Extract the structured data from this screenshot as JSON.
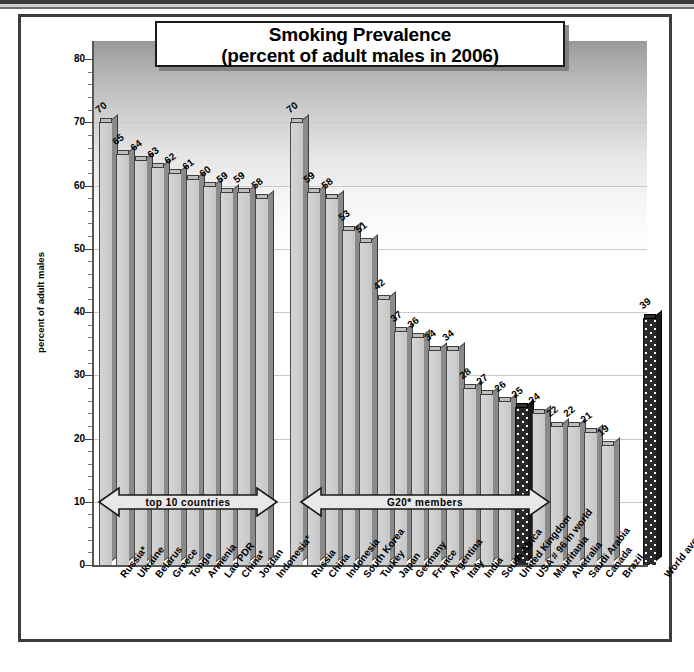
{
  "title": {
    "line1": "Smoking Prevalence",
    "line2": "(percent of adult males in 2006)"
  },
  "chart_data": {
    "type": "bar",
    "title": "Smoking Prevalence (percent of adult males in 2006)",
    "xlabel": "",
    "ylabel": "percent of adult males",
    "ylim": [
      0,
      80
    ],
    "ytick_labels": [
      "0",
      "10",
      "20",
      "30",
      "40",
      "50",
      "60",
      "70",
      "80"
    ],
    "ytick_values": [
      0,
      10,
      20,
      30,
      40,
      50,
      60,
      70,
      80
    ],
    "grid": true,
    "legend": "none",
    "groups": [
      {
        "name": "top 10 countries",
        "annotation": "top 10 countries",
        "categories": [
          "Russia*",
          "Ukraine",
          "Belarus",
          "Greece",
          "Tonga",
          "Armenia",
          "Lao PDR",
          "China*",
          "Jordan",
          "Indonesia*"
        ],
        "values": [
          70,
          65,
          64,
          63,
          62,
          61,
          60,
          59,
          59,
          58
        ]
      },
      {
        "name": "G20* members",
        "annotation": "G20* members",
        "categories": [
          "Russia",
          "China",
          "Indonesia",
          "South Korea",
          "Turkey",
          "Japan",
          "Germany",
          "France",
          "Argentina",
          "Italy",
          "India",
          "South Africa",
          "United Kingdom",
          "USA # 96 in world",
          "Mauritania",
          "Australia",
          "Saudi Arabia",
          "Canada",
          "Brazil"
        ],
        "values": [
          70,
          59,
          58,
          53,
          51,
          42,
          37,
          36,
          34,
          34,
          28,
          27,
          26,
          25,
          24,
          22,
          22,
          21,
          19
        ],
        "highlighted": [
          "USA # 96 in world"
        ]
      },
      {
        "name": "world",
        "annotation": "",
        "categories": [
          "World average"
        ],
        "values": [
          39
        ],
        "highlighted": [
          "World average"
        ]
      }
    ]
  },
  "colors": {
    "bar_face": "#cfcfcf",
    "bar_side": "#8a8a8a",
    "bar_outline": "#3c3c3c",
    "highlight_bar": "#2a2a2a",
    "frame": "#3d3d3d",
    "grid": "#c9c9c9",
    "text": "#000000"
  }
}
